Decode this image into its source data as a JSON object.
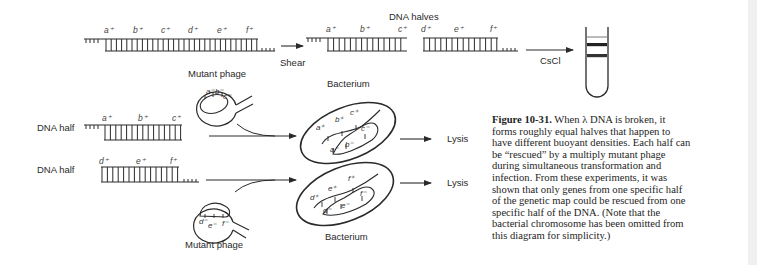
{
  "figure": {
    "title_top": "DNA halves",
    "shear_label": "Shear",
    "cscl_label": "CsCl",
    "top_strand_genes": [
      "a⁺",
      "b⁺",
      "c⁺",
      "d⁺",
      "e⁺",
      "f⁺"
    ],
    "left_half_genes": [
      "a⁺",
      "b⁺",
      "c⁺"
    ],
    "right_half_genes": [
      "d⁺",
      "e⁺",
      "f⁺"
    ],
    "rows": [
      {
        "row_label": "DNA half",
        "half_genes": [
          "a⁺",
          "b⁺",
          "c⁺"
        ],
        "phage_label": "Mutant phage",
        "phage_genes": [
          "a⁻",
          "b⁻",
          "c⁻"
        ],
        "bacterium_label": "Bacterium",
        "bacterium_plus_genes": [
          "a⁺",
          "b⁺",
          "c⁺"
        ],
        "bacterium_minus_genes": [
          "a⁻",
          "b⁻",
          "c⁻"
        ],
        "outcome": "Lysis"
      },
      {
        "row_label": "DNA half",
        "half_genes": [
          "d⁺",
          "e⁺",
          "f⁺"
        ],
        "phage_label": "Mutant phage",
        "phage_genes": [
          "d⁻",
          "e⁻",
          "f⁻"
        ],
        "bacterium_label": "Bacterium",
        "bacterium_plus_genes": [
          "d⁺",
          "e⁺",
          "f⁺"
        ],
        "bacterium_minus_genes": [
          "d⁻",
          "e⁻",
          "f⁻"
        ],
        "outcome": "Lysis"
      }
    ],
    "tube": {
      "bands": 2,
      "band_color": "#222222"
    },
    "colors": {
      "ink": "#2a2a2a",
      "background": "#ffffff"
    }
  },
  "caption": {
    "figure_number": "Figure 10-31.",
    "lines": [
      " When λ DNA is broken, it",
      "forms roughly equal halves that happen to",
      "have different buoyant densities. Each half can",
      "be “rescued” by a multiply mutant phage",
      "during simultaneous transformation and",
      "infection. From these experiments, it was",
      "shown that only genes from one specific half",
      "of the genetic map could be rescued from one",
      "specific half of the DNA. (Note that the",
      "bacterial chromosome has been omitted from",
      "this diagram for simplicity.)"
    ]
  }
}
